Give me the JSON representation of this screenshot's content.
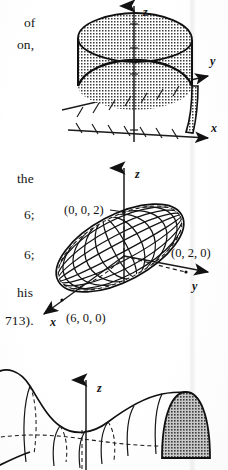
{
  "page": {
    "kind": "scanned-textbook-page-fragment",
    "width": 228,
    "height": 470,
    "background_color": "#ffffff",
    "ink_color": "#161616"
  },
  "margin_text": {
    "note": "partial words clipped by the page edge",
    "lines": [
      {
        "text": "of",
        "x": 24,
        "y": 16
      },
      {
        "text": "on,",
        "x": 17,
        "y": 38
      },
      {
        "text": "the",
        "x": 17,
        "y": 172
      },
      {
        "text": "6;",
        "x": 24,
        "y": 208
      },
      {
        "text": "6;",
        "x": 24,
        "y": 248
      },
      {
        "text": "his",
        "x": 17,
        "y": 286
      },
      {
        "text": "713).",
        "x": 5,
        "y": 314
      }
    ]
  },
  "figures": [
    {
      "id": "figure-half-cylinder",
      "caption_visible": false,
      "description": "Solid half-cylinder standing above the xy-plane with tick-marked axes",
      "axes": [
        {
          "name": "z-axis",
          "label": "z"
        },
        {
          "name": "y-axis",
          "label": "y"
        },
        {
          "name": "x-axis",
          "label": "x"
        }
      ],
      "shading": "stipple-dot-fill",
      "tick_marks": {
        "x_axis": 8,
        "y_axis": 8,
        "z_axis": 4
      }
    },
    {
      "id": "figure-ellipsoid",
      "description": "Wireframe ellipsoid with labeled axis intercepts",
      "axes": [
        {
          "name": "z-axis",
          "label": "z"
        },
        {
          "name": "y-axis",
          "label": "y"
        },
        {
          "name": "x-axis",
          "label": "x"
        }
      ],
      "point_labels": [
        {
          "name": "z-intercept",
          "text": "(0, 0, 2)"
        },
        {
          "name": "y-intercept",
          "text": "(0, 2, 0)"
        },
        {
          "name": "x-intercept",
          "text": "(6, 0, 0)"
        }
      ],
      "mesh": {
        "u_lines": 9,
        "v_lines": 7,
        "hidden_lines": "dashed"
      }
    },
    {
      "id": "figure-surface-of-revolution",
      "description": "Surface of revolution about a horizontal axis, clipped by the bottom page edge",
      "axes": [
        {
          "name": "z-axis",
          "label": "z"
        }
      ],
      "shading": "stipple-dot-fill",
      "clipped": true
    }
  ]
}
